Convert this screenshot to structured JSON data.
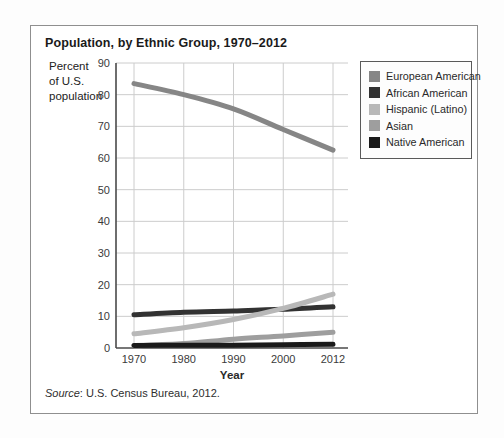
{
  "figure": {
    "title": "Population, by Ethnic Group, 1970–2012",
    "y_axis_label_lines": [
      "Percent",
      "of U.S.",
      "population"
    ],
    "x_axis_label": "Year",
    "source_label": "Source",
    "source_text": ": U.S. Census Bureau, 2012."
  },
  "colors": {
    "gridline": "#cccccc",
    "axis": "#4a4a4a",
    "frame_border": "#8f8f8f",
    "legend_border": "#5a5a5a"
  },
  "chart_data": {
    "type": "line",
    "title": "Population, by Ethnic Group, 1970–2012",
    "xlabel": "Year",
    "ylabel": "Percent of U.S. population",
    "x_tick_labels": [
      "1970",
      "1980",
      "1990",
      "2000",
      "2012"
    ],
    "y_ticks": [
      0,
      10,
      20,
      30,
      40,
      50,
      60,
      70,
      80,
      90
    ],
    "ylim": [
      0,
      90
    ],
    "grid": true,
    "legend_position": "outside-upper-right",
    "series": [
      {
        "name": "European American",
        "color": "#868686",
        "values": [
          83.5,
          80,
          75.5,
          69,
          62.5
        ]
      },
      {
        "name": "African American",
        "color": "#323232",
        "values": [
          10.5,
          11.3,
          11.7,
          12.2,
          13
        ]
      },
      {
        "name": "Hispanic (Latino)",
        "color": "#b8b8b8",
        "values": [
          4.5,
          6.4,
          9,
          12.5,
          17
        ]
      },
      {
        "name": "Asian",
        "color": "#9e9e9e",
        "values": [
          0.7,
          1.4,
          2.8,
          3.8,
          5
        ]
      },
      {
        "name": "Native American",
        "color": "#1a1a1a",
        "values": [
          0.8,
          0.9,
          0.9,
          1,
          1.2
        ]
      }
    ]
  }
}
